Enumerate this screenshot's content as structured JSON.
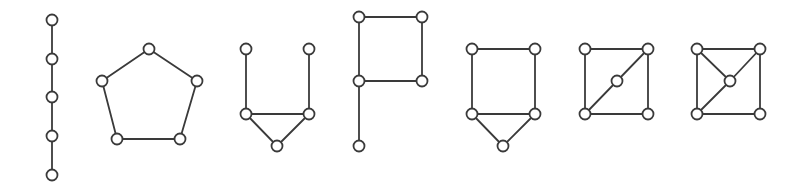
{
  "diagram": {
    "title": "",
    "node_radius": 5.5,
    "stroke_color": "#3a3a3a",
    "graphs": [
      {
        "name": "path-graph",
        "nodes": [
          [
            52,
            20
          ],
          [
            52,
            59
          ],
          [
            52,
            97
          ],
          [
            52,
            136
          ],
          [
            52,
            175
          ]
        ],
        "edges": [
          [
            0,
            1
          ],
          [
            1,
            2
          ],
          [
            2,
            3
          ],
          [
            3,
            4
          ]
        ]
      },
      {
        "name": "cycle-graph",
        "nodes": [
          [
            149,
            49
          ],
          [
            102,
            81
          ],
          [
            197,
            81
          ],
          [
            117,
            139
          ],
          [
            180,
            139
          ]
        ],
        "edges": [
          [
            0,
            1
          ],
          [
            0,
            2
          ],
          [
            1,
            3
          ],
          [
            2,
            4
          ],
          [
            3,
            4
          ]
        ]
      },
      {
        "name": "bull-graph",
        "nodes": [
          [
            246,
            49
          ],
          [
            309,
            49
          ],
          [
            246,
            114
          ],
          [
            309,
            114
          ],
          [
            277,
            146
          ]
        ],
        "edges": [
          [
            0,
            2
          ],
          [
            1,
            3
          ],
          [
            2,
            3
          ],
          [
            2,
            4
          ],
          [
            3,
            4
          ]
        ]
      },
      {
        "name": "p-graph",
        "nodes": [
          [
            359,
            17
          ],
          [
            422,
            17
          ],
          [
            359,
            81
          ],
          [
            422,
            81
          ],
          [
            359,
            146
          ]
        ],
        "edges": [
          [
            0,
            1
          ],
          [
            0,
            2
          ],
          [
            1,
            3
          ],
          [
            2,
            3
          ],
          [
            2,
            4
          ]
        ]
      },
      {
        "name": "house-graph",
        "nodes": [
          [
            472,
            49
          ],
          [
            535,
            49
          ],
          [
            472,
            114
          ],
          [
            535,
            114
          ],
          [
            503,
            146
          ]
        ],
        "edges": [
          [
            0,
            1
          ],
          [
            0,
            2
          ],
          [
            1,
            3
          ],
          [
            2,
            3
          ],
          [
            2,
            4
          ],
          [
            3,
            4
          ]
        ]
      },
      {
        "name": "house-x-partial-graph",
        "nodes": [
          [
            585,
            49
          ],
          [
            648,
            49
          ],
          [
            585,
            114
          ],
          [
            648,
            114
          ],
          [
            617,
            81
          ]
        ],
        "edges": [
          [
            0,
            1
          ],
          [
            0,
            2
          ],
          [
            1,
            3
          ],
          [
            2,
            3
          ],
          [
            1,
            4
          ],
          [
            4,
            2
          ]
        ]
      },
      {
        "name": "gem-variant-graph",
        "nodes": [
          [
            697,
            49
          ],
          [
            760,
            49
          ],
          [
            697,
            114
          ],
          [
            760,
            114
          ],
          [
            730,
            81
          ]
        ],
        "edges": [
          [
            0,
            1
          ],
          [
            0,
            2
          ],
          [
            1,
            3
          ],
          [
            2,
            3
          ],
          [
            0,
            4
          ],
          [
            1,
            4
          ],
          [
            4,
            2
          ]
        ]
      }
    ]
  }
}
